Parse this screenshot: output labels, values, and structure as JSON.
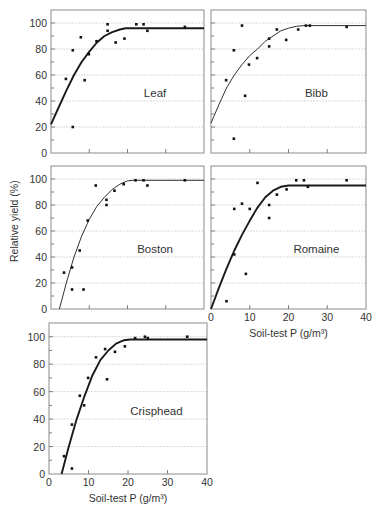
{
  "figure": {
    "ylabel": "Relative yield (%)",
    "xlabel": "Soil-test P (g/m³)",
    "line_color": "#1a1a1a",
    "grid_color": "#cfcfcf",
    "frame_color": "#8c8c8c",
    "point_color": "#111111"
  },
  "chart_data": [
    {
      "type": "scatter",
      "title": "Leaf",
      "xlabel": "",
      "ylabel": "Relative yield (%)",
      "xlim": [
        0,
        40
      ],
      "ylim": [
        0,
        110
      ],
      "xticks": [
        0,
        10,
        20,
        30,
        40
      ],
      "yticks": [
        0,
        20,
        40,
        60,
        80,
        100
      ],
      "show_xtick_labels": false,
      "show_ytick_labels": true,
      "grid": true,
      "curve_weight": "bold",
      "points": {
        "x": [
          3.9,
          5.7,
          5.7,
          7.8,
          8.8,
          9.9,
          11.9,
          14.8,
          14.8,
          16.9,
          19.2,
          22.3,
          24.2,
          25.2,
          35
        ],
        "y": [
          57,
          79,
          20,
          89,
          56,
          76,
          86,
          99,
          94,
          85,
          88,
          99,
          99,
          94,
          97
        ]
      },
      "fit": {
        "x": [
          0,
          2,
          4,
          6,
          8,
          10,
          12,
          14,
          16,
          18,
          19.5,
          40
        ],
        "y": [
          22,
          35,
          48,
          60,
          70,
          78,
          85,
          90,
          93,
          95,
          96,
          96
        ]
      }
    },
    {
      "type": "scatter",
      "title": "Bibb",
      "xlabel": "",
      "ylabel": "",
      "xlim": [
        0,
        40
      ],
      "ylim": [
        0,
        110
      ],
      "xticks": [
        0,
        10,
        20,
        30,
        40
      ],
      "yticks": [
        0,
        20,
        40,
        60,
        80,
        100
      ],
      "show_xtick_labels": false,
      "show_ytick_labels": false,
      "grid": true,
      "curve_weight": "thin",
      "points": {
        "x": [
          3.9,
          5.9,
          5.9,
          8.0,
          8.8,
          9.8,
          11.9,
          15.0,
          15.0,
          17.0,
          19.4,
          22.5,
          24.5,
          25.5,
          35
        ],
        "y": [
          56,
          79,
          11,
          98,
          44,
          68,
          73,
          88,
          82,
          95,
          87,
          95,
          98,
          98,
          97
        ]
      },
      "fit": {
        "x": [
          0,
          2,
          4,
          6,
          8,
          10,
          12,
          14,
          16,
          18,
          20,
          22,
          24,
          40
        ],
        "y": [
          23,
          37,
          50,
          60,
          68,
          75,
          80,
          86,
          90,
          94,
          96,
          97.5,
          98,
          98
        ]
      }
    },
    {
      "type": "scatter",
      "title": "Boston",
      "xlabel": "",
      "ylabel": "Relative yield (%)",
      "xlim": [
        0,
        40
      ],
      "ylim": [
        0,
        110
      ],
      "xticks": [
        0,
        10,
        20,
        30,
        40
      ],
      "yticks": [
        0,
        20,
        40,
        60,
        80,
        100
      ],
      "show_xtick_labels": false,
      "show_ytick_labels": true,
      "grid": true,
      "curve_weight": "thin",
      "points": {
        "x": [
          3.4,
          5.5,
          5.5,
          7.5,
          8.5,
          9.6,
          11.7,
          14.5,
          14.5,
          16.6,
          19.0,
          22.1,
          24.2,
          25.2,
          35
        ],
        "y": [
          28,
          32,
          15,
          45,
          15,
          68,
          95,
          84,
          80,
          91,
          96,
          99,
          99,
          95,
          99
        ]
      },
      "fit": {
        "x": [
          2.2,
          4,
          6,
          8,
          10,
          12,
          14,
          16,
          18,
          20,
          21.5,
          40
        ],
        "y": [
          0,
          20,
          40,
          56,
          69,
          79,
          86,
          92,
          96,
          98.5,
          99,
          99
        ]
      }
    },
    {
      "type": "scatter",
      "title": "Romaine",
      "xlabel": "Soil-test P (g/m³)",
      "ylabel": "",
      "xlim": [
        0,
        40
      ],
      "ylim": [
        0,
        110
      ],
      "xticks": [
        0,
        10,
        20,
        30,
        40
      ],
      "yticks": [
        0,
        20,
        40,
        60,
        80,
        100
      ],
      "xtick_labels": [
        "0",
        "10",
        "20",
        "30",
        "40"
      ],
      "show_xtick_labels": true,
      "show_ytick_labels": false,
      "grid": true,
      "curve_weight": "bold",
      "points": {
        "x": [
          4,
          6,
          6,
          8,
          9,
          10,
          12,
          15,
          15,
          17,
          19.5,
          22,
          24,
          25,
          35
        ],
        "y": [
          6,
          42,
          77,
          81,
          27,
          77,
          97,
          80,
          70,
          88,
          92,
          99,
          99,
          94,
          99
        ]
      },
      "fit": {
        "x": [
          0,
          2,
          4,
          6,
          8,
          10,
          12,
          14,
          16,
          18,
          20,
          40
        ],
        "y": [
          0,
          16,
          31,
          45,
          57,
          68,
          78,
          86,
          91,
          94,
          95,
          95
        ]
      }
    },
    {
      "type": "scatter",
      "title": "Crisphead",
      "xlabel": "Soil-test P (g/m³)",
      "ylabel": "",
      "xlim": [
        0,
        40
      ],
      "ylim": [
        0,
        110
      ],
      "xticks": [
        0,
        10,
        20,
        30,
        40
      ],
      "yticks": [
        0,
        20,
        40,
        60,
        80,
        100
      ],
      "xtick_labels": [
        "0",
        "10",
        "20",
        "30",
        "40"
      ],
      "show_xtick_labels": true,
      "show_ytick_labels": true,
      "grid": true,
      "curve_weight": "bold",
      "points": {
        "x": [
          3.8,
          5.8,
          5.8,
          7.8,
          8.9,
          9.9,
          11.9,
          14.2,
          14.7,
          16.7,
          19.2,
          21.8,
          24.3,
          25,
          35
        ],
        "y": [
          13,
          4,
          36,
          57,
          50,
          70,
          85,
          91,
          69,
          89,
          93,
          99,
          100,
          99,
          100
        ]
      },
      "fit": {
        "x": [
          3.2,
          5,
          7,
          9,
          11,
          13,
          15,
          17,
          19,
          20.5,
          40
        ],
        "y": [
          0,
          20,
          40,
          57,
          72,
          83,
          90,
          95,
          97.5,
          98,
          98
        ]
      }
    }
  ],
  "panels_layout": [
    {
      "left": 51,
      "top": 10,
      "width": 153,
      "height": 143
    },
    {
      "left": 211,
      "top": 10,
      "width": 155,
      "height": 143
    },
    {
      "left": 51,
      "top": 166,
      "width": 153,
      "height": 143
    },
    {
      "left": 211,
      "top": 166,
      "width": 155,
      "height": 143
    },
    {
      "left": 49,
      "top": 323,
      "width": 158,
      "height": 151
    }
  ]
}
